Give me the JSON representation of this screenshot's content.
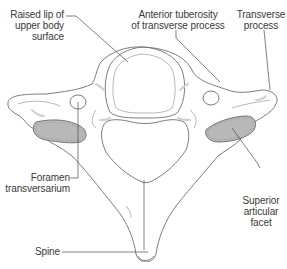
{
  "figure": {
    "colors": {
      "outline": "#6e6e6e",
      "leader_line": "#4a4a4a",
      "facet_fill": "#b8b8b8",
      "facet_stroke": "#6a6a6a",
      "shading": "#d4d4d4",
      "text": "#3a3a3a"
    },
    "labels": {
      "raised_lip": {
        "line1": "Raised lip of",
        "line2": "upper body",
        "line3": "surface"
      },
      "anterior_tuberosity": {
        "line1": "Anterior tuberosity",
        "line2": "of transverse process"
      },
      "transverse_process": {
        "line1": "Transverse",
        "line2": "process"
      },
      "foramen_transversarium": {
        "line1": "Foramen",
        "line2": "transversarium"
      },
      "superior_articular_facet": {
        "line1": "Superior",
        "line2": "articular",
        "line3": "facet"
      },
      "spine": {
        "line1": "Spine"
      }
    }
  }
}
